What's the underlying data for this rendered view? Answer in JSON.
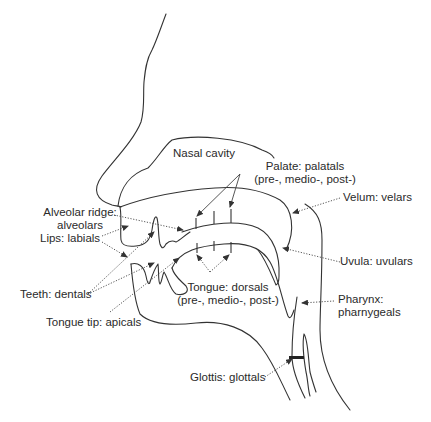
{
  "diagram": {
    "type": "anatomical sagittal section of the vocal tract",
    "labels": {
      "nasal_cavity": "Nasal cavity",
      "palate_line1": "Palate: palatals",
      "palate_line2": "(pre-, medio-, post-)",
      "velum": "Velum: velars",
      "alveolar_line1": "Alveolar ridge:",
      "alveolar_line2": "alveolars",
      "lips": "Lips: labials",
      "uvula": "Uvula: uvulars",
      "teeth": "Teeth: dentals",
      "tongue_line1": "Tongue: dorsals",
      "tongue_line2": "(pre-, medio-, post-)",
      "tongue_tip": "Tongue tip: apicals",
      "pharynx_line1": "Pharynx:",
      "pharynx_line2": "pharnygeals",
      "glottis": "Glottis: glottals"
    },
    "colors": {
      "line": "#333333",
      "text": "#2a2a2a",
      "background": "#ffffff"
    }
  }
}
